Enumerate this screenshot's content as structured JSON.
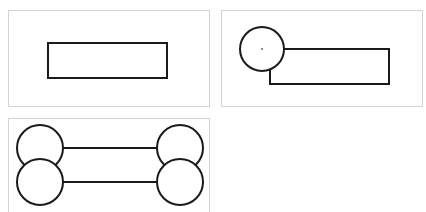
{
  "diagram": {
    "stroke_color": "#1a1a1a",
    "panel_border_color": "#d4d4d4",
    "panels": [
      {
        "id": "panel-1",
        "description": "rectangle",
        "box": {
          "x": 8,
          "y": 10,
          "w": 202,
          "h": 97
        },
        "shapes": [
          {
            "type": "rect",
            "x": 48,
            "y": 43,
            "w": 119,
            "h": 35
          }
        ]
      },
      {
        "id": "panel-2",
        "description": "circle overlapping rectangle corner",
        "box": {
          "x": 221,
          "y": 10,
          "w": 202,
          "h": 97
        },
        "shapes": [
          {
            "type": "circle",
            "cx": 262,
            "cy": 49,
            "r": 22,
            "center_dot": true
          },
          {
            "type": "rect",
            "x": 270,
            "y": 49,
            "w": 119,
            "h": 35
          }
        ]
      },
      {
        "id": "panel-3",
        "description": "four circles connected by two horizontal lines",
        "box": {
          "x": 8,
          "y": 118,
          "w": 202,
          "h": 100
        },
        "shapes": [
          {
            "type": "circle",
            "cx": 40,
            "cy": 148,
            "r": 23
          },
          {
            "type": "circle",
            "cx": 40,
            "cy": 182,
            "r": 23
          },
          {
            "type": "circle",
            "cx": 180,
            "cy": 148,
            "r": 23
          },
          {
            "type": "circle",
            "cx": 180,
            "cy": 182,
            "r": 23
          },
          {
            "type": "line",
            "x1": 63,
            "y1": 148,
            "x2": 157,
            "y2": 148
          },
          {
            "type": "line",
            "x1": 63,
            "y1": 182,
            "x2": 157,
            "y2": 182
          }
        ]
      }
    ]
  }
}
